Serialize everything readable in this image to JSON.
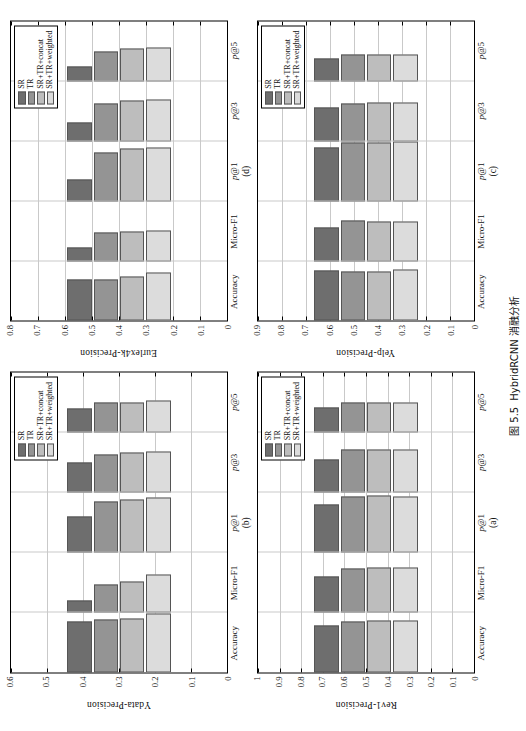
{
  "figure": {
    "caption_prefix": "图 5.5",
    "caption_text": "HybridRCNN 消融分析"
  },
  "legend": {
    "entries": [
      {
        "label": "SR",
        "color": "#6e6e6e"
      },
      {
        "label": "TR",
        "color": "#949494"
      },
      {
        "label": "SR+TR+concat",
        "color": "#bdbdbd"
      },
      {
        "label": "SR+TR+weighted",
        "color": "#dcdcdc"
      }
    ]
  },
  "chart_data": [
    {
      "panel": "(a)",
      "type": "bar",
      "orientation": "vertical",
      "title": "",
      "xlabel": "",
      "ylabel": "Rev1-Precision",
      "ylim": [
        0,
        1
      ],
      "yticks": [
        0,
        0.1,
        0.2,
        0.3,
        0.4,
        0.5,
        0.6,
        0.7,
        0.8,
        0.9,
        1
      ],
      "ytick_labels": [
        "0",
        "0.1",
        "0.2",
        "0.3",
        "0.4",
        "0.5",
        "0.6",
        "0.7",
        "0.8",
        "0.9",
        "1"
      ],
      "grid": true,
      "legend_position": "upper-right",
      "categories": [
        "Accuracy",
        "Micro-F1",
        "p@1",
        "p@3",
        "p@5"
      ],
      "series": [
        {
          "name": "SR",
          "values": [
            0.78,
            0.61,
            0.8,
            0.56,
            0.42
          ]
        },
        {
          "name": "TR",
          "values": [
            0.85,
            0.74,
            0.94,
            0.72,
            0.5
          ]
        },
        {
          "name": "SR+TR+concat",
          "values": [
            0.87,
            0.75,
            0.95,
            0.73,
            0.51
          ]
        },
        {
          "name": "SR+TR+weighted",
          "values": [
            0.86,
            0.76,
            0.94,
            0.73,
            0.5
          ]
        }
      ]
    },
    {
      "panel": "(b)",
      "type": "bar",
      "orientation": "vertical",
      "title": "",
      "xlabel": "",
      "ylabel": "Ydata-Precision",
      "ylim": [
        0,
        0.6
      ],
      "yticks": [
        0,
        0.1,
        0.2,
        0.3,
        0.4,
        0.5,
        0.6
      ],
      "ytick_labels": [
        "0",
        "0.1",
        "0.2",
        "0.3",
        "0.4",
        "0.5",
        "0.6"
      ],
      "grid": true,
      "legend_position": "upper-right",
      "categories": [
        "Accuracy",
        "Micro-F1",
        "p@1",
        "p@3",
        "p@5"
      ],
      "series": [
        {
          "name": "SR",
          "values": [
            0.51,
            0.12,
            0.365,
            0.3,
            0.245
          ]
        },
        {
          "name": "TR",
          "values": [
            0.53,
            0.28,
            0.51,
            0.38,
            0.3
          ]
        },
        {
          "name": "SR+TR+concat",
          "values": [
            0.545,
            0.315,
            0.53,
            0.405,
            0.305
          ]
        },
        {
          "name": "SR+TR+weighted",
          "values": [
            0.595,
            0.38,
            0.555,
            0.415,
            0.32
          ]
        }
      ]
    },
    {
      "panel": "(c)",
      "type": "bar",
      "orientation": "vertical",
      "title": "",
      "xlabel": "",
      "ylabel": "Yelp-Precision",
      "ylim": [
        0,
        0.9
      ],
      "yticks": [
        0,
        0.1,
        0.2,
        0.3,
        0.4,
        0.5,
        0.6,
        0.7,
        0.8,
        0.9
      ],
      "ytick_labels": [
        "0",
        "0.1",
        "0.2",
        "0.3",
        "0.4",
        "0.5",
        "0.6",
        "0.7",
        "0.8",
        "0.9"
      ],
      "grid": true,
      "legend_position": "upper-right",
      "categories": [
        "Accuracy",
        "Micro-F1",
        "p@1",
        "p@3",
        "p@5"
      ],
      "series": [
        {
          "name": "SR",
          "values": [
            0.765,
            0.5,
            0.81,
            0.5,
            0.345
          ]
        },
        {
          "name": "TR",
          "values": [
            0.745,
            0.605,
            0.885,
            0.575,
            0.4
          ]
        },
        {
          "name": "SR+TR+concat",
          "values": [
            0.75,
            0.595,
            0.88,
            0.59,
            0.4
          ]
        },
        {
          "name": "SR+TR+weighted",
          "values": [
            0.775,
            0.59,
            0.9,
            0.585,
            0.4
          ]
        }
      ]
    },
    {
      "panel": "(d)",
      "type": "bar",
      "orientation": "vertical",
      "title": "",
      "xlabel": "",
      "ylabel": "Eurlex4k-Precision",
      "ylim": [
        0,
        0.8
      ],
      "yticks": [
        0,
        0.1,
        0.2,
        0.3,
        0.4,
        0.5,
        0.6,
        0.7,
        0.8
      ],
      "ytick_labels": [
        "0",
        "0.1",
        "0.2",
        "0.3",
        "0.4",
        "0.5",
        "0.6",
        "0.7",
        "0.8"
      ],
      "grid": true,
      "legend_position": "upper-right",
      "categories": [
        "Accuracy",
        "Micro-F1",
        "p@1",
        "p@3",
        "p@5"
      ],
      "series": [
        {
          "name": "SR",
          "values": [
            0.56,
            0.18,
            0.295,
            0.245,
            0.2
          ]
        },
        {
          "name": "TR",
          "values": [
            0.55,
            0.385,
            0.655,
            0.505,
            0.395
          ]
        },
        {
          "name": "SR+TR+concat",
          "values": [
            0.6,
            0.4,
            0.7,
            0.545,
            0.445
          ]
        },
        {
          "name": "SR+TR+weighted",
          "values": [
            0.65,
            0.41,
            0.715,
            0.56,
            0.45
          ]
        }
      ]
    }
  ]
}
